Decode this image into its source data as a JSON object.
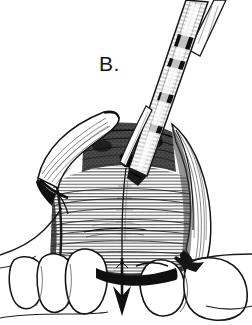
{
  "figure": {
    "panel_label": "B.",
    "caption_text": "",
    "width_px": 252,
    "height_px": 325,
    "background_color": "#ffffff",
    "ink_color": "#141414",
    "style": "pen-and-ink line drawing, black and white, stippled and hatched shading"
  },
  "annotations": {
    "arrow": {
      "name": "downward-force-arrow",
      "direction": "down",
      "x": 122,
      "y_top": 258,
      "y_bottom": 314,
      "color": "#111111",
      "meaning": "direction of downfracture / displacement"
    }
  },
  "instrument": {
    "name": "osteotome-handpiece",
    "description": "segmented straight instrument entering the surgical field from upper right",
    "segments": 4,
    "tip_x": 128,
    "tip_y": 170,
    "top_x": 196,
    "top_y": 2,
    "band_color": "#101010",
    "body_fill": "#fbfbfb"
  },
  "anatomy": {
    "flap_left": {
      "name": "left-mucoperiosteal-flap",
      "label": "reflected soft tissue flap (left)"
    },
    "flap_right": {
      "name": "right-mucoperiosteal-flap",
      "label": "reflected soft tissue flap (right)"
    },
    "bone": {
      "name": "exposed-maxillary-bone",
      "label": "exposed bone with horizontal hatch shading"
    },
    "osteotomy_window": {
      "name": "bony-window-opening",
      "label": "dark bony aperture",
      "cx": 127,
      "cy": 160,
      "rx": 6,
      "ry": 7
    },
    "midline": {
      "name": "midline-osteotomy-line",
      "label": "vertical midline cut"
    },
    "teeth_left": {
      "name": "teeth-left-group",
      "count": 3,
      "label": "left maxillary teeth"
    },
    "teeth_right": {
      "name": "teeth-right-group",
      "count": 2,
      "label": "right maxillary teeth"
    }
  }
}
